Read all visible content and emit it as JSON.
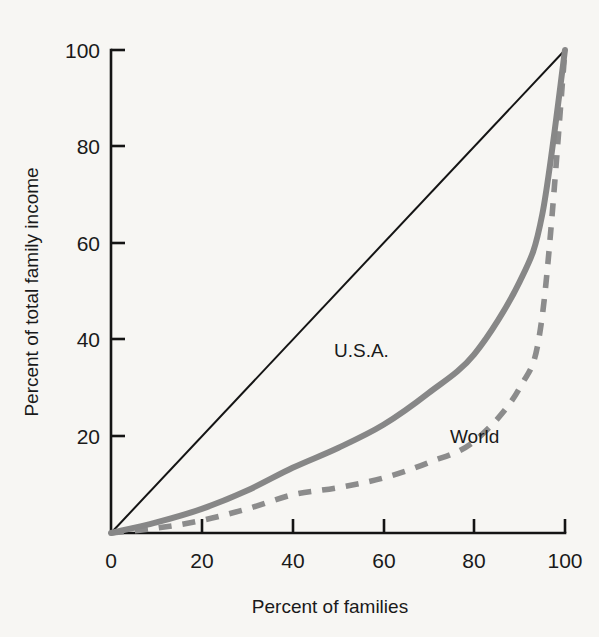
{
  "chart_data": {
    "type": "line",
    "title": "",
    "xlabel": "Percent of families",
    "ylabel": "Percent of total family income",
    "xlim": [
      0,
      100
    ],
    "ylim": [
      0,
      100
    ],
    "grid": false,
    "legend_position": "inline-annotation",
    "x_ticks": [
      "0",
      "20",
      "40",
      "60",
      "80",
      "100"
    ],
    "y_ticks": [
      "20",
      "40",
      "60",
      "80",
      "100"
    ],
    "x_tick_values": [
      0,
      20,
      40,
      60,
      80,
      100
    ],
    "y_tick_values": [
      20,
      40,
      60,
      80,
      100
    ],
    "x": [
      0,
      10,
      20,
      30,
      40,
      50,
      60,
      70,
      80,
      90,
      95,
      100
    ],
    "series": [
      {
        "name": "line-of-equality",
        "label": "",
        "style": "solid-thin-black",
        "color": "#141414",
        "values": [
          0,
          10,
          20,
          30,
          40,
          50,
          60,
          70,
          80,
          90,
          95,
          100
        ]
      },
      {
        "name": "U.S.A.",
        "label": "U.S.A.",
        "style": "solid-thick-gray",
        "color": "#878787",
        "values": [
          0,
          2.2,
          5.0,
          8.8,
          13.5,
          17.6,
          22.4,
          29.0,
          37.0,
          52.0,
          66.0,
          100
        ]
      },
      {
        "name": "World",
        "label": "World",
        "style": "dashed-gray",
        "color": "#8c8c8c",
        "values": [
          0,
          1.0,
          2.6,
          5.0,
          7.9,
          9.4,
          11.4,
          14.6,
          19.0,
          30.0,
          45.0,
          100
        ]
      }
    ],
    "annotations": [
      {
        "text": "U.S.A.",
        "x": 45,
        "y": 37
      },
      {
        "text": "World",
        "x": 72,
        "y": 20
      }
    ]
  },
  "colors": {
    "background": "#f7f6f3",
    "axis": "#141414",
    "usa_curve": "#878787",
    "world_curve": "#8c8c8c",
    "text": "#1a1a1a"
  }
}
